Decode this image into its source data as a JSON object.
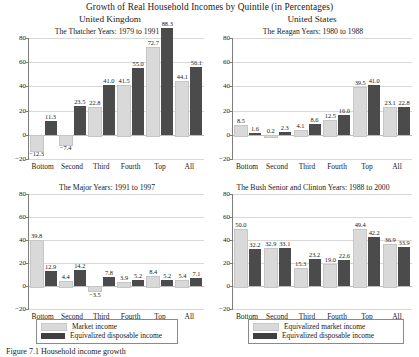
{
  "figure": {
    "title": "Growth of Real Household Incomes by Quintile (in Percentages)",
    "country_left": "United Kingdom",
    "country_right": "United States",
    "caption": "Figure    7.1    Household income growth"
  },
  "axis": {
    "ticks": [
      "80",
      "60",
      "40",
      "20",
      "0",
      "-20"
    ],
    "ymin": -20,
    "ymax": 80
  },
  "categories": [
    "Bottom",
    "Second",
    "Third",
    "Fourth",
    "Top",
    "All"
  ],
  "legend_left": {
    "series_a": "Market income",
    "series_b": "Equivalized disposable income"
  },
  "legend_right": {
    "series_a": "Equivalized market income",
    "series_b": "Equivalized disposable income"
  },
  "colors": {
    "series_a": "#d9d9d9",
    "series_b": "#4b4b4b",
    "axis": "#7d7d7d",
    "grid": "#d8d8d8"
  },
  "chart_data": [
    {
      "id": "thatcher",
      "type": "bar",
      "title": "The Thatcher Years: 1979 to 1991",
      "panel": "top-left",
      "categories": [
        "Bottom",
        "Second",
        "Third",
        "Fourth",
        "Top",
        "All"
      ],
      "xlabel": "",
      "ylabel": "",
      "ylim": [
        -20,
        80
      ],
      "grid": true,
      "legend": "bottom",
      "series": [
        {
          "name": "Market income",
          "values": [
            -12.3,
            -7.4,
            22.8,
            41.5,
            72.7,
            44.1
          ]
        },
        {
          "name": "Equivalized disposable income",
          "values": [
            11.3,
            23.5,
            41.0,
            55.0,
            88.3,
            56.1
          ]
        }
      ]
    },
    {
      "id": "reagan",
      "type": "bar",
      "title": "The Reagan Years: 1980 to 1988",
      "panel": "top-right",
      "categories": [
        "Bottom",
        "Second",
        "Third",
        "Fourth",
        "Top",
        "All"
      ],
      "xlabel": "",
      "ylabel": "",
      "ylim": [
        -20,
        80
      ],
      "grid": true,
      "legend": "bottom",
      "series": [
        {
          "name": "Equivalized market income",
          "values": [
            8.5,
            0.2,
            4.1,
            12.5,
            39.5,
            23.1
          ]
        },
        {
          "name": "Equivalized disposable income",
          "values": [
            1.6,
            2.3,
            8.6,
            16.0,
            41.0,
            22.8
          ]
        }
      ]
    },
    {
      "id": "major",
      "type": "bar",
      "title": "The Major Years: 1991 to 1997",
      "panel": "bottom-left",
      "categories": [
        "Bottom",
        "Second",
        "Third",
        "Fourth",
        "Top",
        "All"
      ],
      "xlabel": "",
      "ylabel": "",
      "ylim": [
        -20,
        80
      ],
      "grid": true,
      "legend": "bottom",
      "series": [
        {
          "name": "Market income",
          "values": [
            39.8,
            4.4,
            -3.5,
            3.9,
            8.4,
            5.4
          ]
        },
        {
          "name": "Equivalized disposable income",
          "values": [
            12.9,
            14.2,
            7.8,
            5.2,
            5.2,
            7.1
          ]
        }
      ]
    },
    {
      "id": "bush-clinton",
      "type": "bar",
      "title": "The Bush Senior and Clinton Years: 1988 to 2000",
      "panel": "bottom-right",
      "categories": [
        "Bottom",
        "Second",
        "Third",
        "Fourth",
        "Top",
        "All"
      ],
      "xlabel": "",
      "ylabel": "",
      "ylim": [
        -20,
        80
      ],
      "grid": true,
      "legend": "bottom",
      "series": [
        {
          "name": "Equivalized market income",
          "values": [
            50.0,
            32.9,
            15.3,
            19.0,
            49.4,
            36.9
          ]
        },
        {
          "name": "Equivalized disposable income",
          "values": [
            32.2,
            33.1,
            23.2,
            22.6,
            42.2,
            33.9
          ]
        }
      ]
    }
  ]
}
